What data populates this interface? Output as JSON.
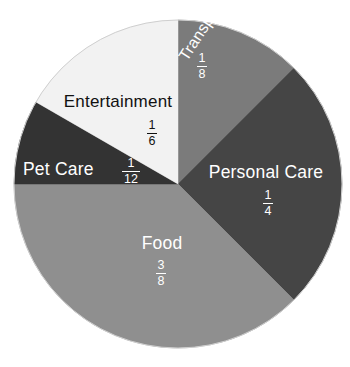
{
  "chart_data": {
    "type": "pie",
    "title": "",
    "subtitle": "",
    "xlabel": "",
    "ylabel": "",
    "legend_position": "none",
    "grid": false,
    "start_angle_deg": 0,
    "direction": "clockwise",
    "categories": [
      "Transportation",
      "Personal Care",
      "Food",
      "Pet Care",
      "Entertainment"
    ],
    "values": [
      0.125,
      0.25,
      0.375,
      0.0833333,
      0.1666667
    ],
    "value_labels": [
      "1/8",
      "1/4",
      "3/8",
      "1/12",
      "1/6"
    ],
    "colors": [
      "#7b7b7b",
      "#454545",
      "#8f8f8f",
      "#333333",
      "#f2f2f2"
    ],
    "slices": [
      {
        "name": "Transportation",
        "label": "Transportation",
        "fraction_numerator": "1",
        "fraction_denominator": "8",
        "value": 0.125,
        "percent": "12.5%",
        "color": "#7b7b7b",
        "text_color": "#ffffff",
        "start_angle_deg": 0,
        "end_angle_deg": 45
      },
      {
        "name": "Personal Care",
        "label": "Personal Care",
        "fraction_numerator": "1",
        "fraction_denominator": "4",
        "value": 0.25,
        "percent": "25%",
        "color": "#454545",
        "text_color": "#ffffff",
        "start_angle_deg": 45,
        "end_angle_deg": 135
      },
      {
        "name": "Food",
        "label": "Food",
        "fraction_numerator": "3",
        "fraction_denominator": "8",
        "value": 0.375,
        "percent": "37.5%",
        "color": "#8f8f8f",
        "text_color": "#ffffff",
        "start_angle_deg": 135,
        "end_angle_deg": 270
      },
      {
        "name": "Pet Care",
        "label": "Pet Care",
        "fraction_numerator": "1",
        "fraction_denominator": "12",
        "value": 0.0833333,
        "percent": "8.3%",
        "color": "#333333",
        "text_color": "#ffffff",
        "start_angle_deg": 270,
        "end_angle_deg": 300
      },
      {
        "name": "Entertainment",
        "label": "Entertainment",
        "fraction_numerator": "1",
        "fraction_denominator": "6",
        "value": 0.1666667,
        "percent": "16.7%",
        "color": "#f2f2f2",
        "text_color": "#111111",
        "start_angle_deg": 300,
        "end_angle_deg": 360
      }
    ],
    "geometry": {
      "center_x": 178,
      "center_y": 184,
      "radius": 164
    },
    "background_color": "#ffffff",
    "outline_color": "#cfcfcf"
  }
}
